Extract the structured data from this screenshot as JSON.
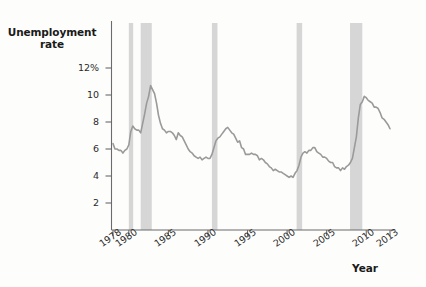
{
  "chart_data": {
    "type": "line",
    "title": "",
    "xlabel": "Year",
    "ylabel": "Unemployment rate",
    "ylabel_line1": "Unemployment",
    "ylabel_line2": "rate",
    "xlim": [
      1978,
      2013
    ],
    "ylim": [
      0,
      12.6
    ],
    "grid": false,
    "legend": null,
    "line_color": "#9a9a9a",
    "recession_band_color": "#d6d6d6",
    "axis_color": "#6b6b6b",
    "background_color": "#fdfdfc",
    "ytick_labels": [
      "12%",
      "10",
      "8",
      "6",
      "4",
      "2"
    ],
    "ytick_values": [
      12,
      10,
      8,
      6,
      4,
      2
    ],
    "xtick_labels": [
      "1978",
      "1980",
      "1985",
      "1990",
      "1995",
      "2000",
      "2005",
      "2010",
      "2013"
    ],
    "xtick_values": [
      1978,
      1980,
      1985,
      1990,
      1995,
      2000,
      2005,
      2010,
      2013
    ],
    "recession_bands": [
      {
        "label": "1980 recession",
        "start": 1980.0,
        "end": 1980.55
      },
      {
        "label": "1981-82 recession",
        "start": 1981.5,
        "end": 1982.9
      },
      {
        "label": "1990-91 recession",
        "start": 1990.5,
        "end": 1991.2
      },
      {
        "label": "2001 recession",
        "start": 2001.2,
        "end": 2001.9
      },
      {
        "label": "2007-09 recession",
        "start": 2007.95,
        "end": 2009.5
      }
    ],
    "series": [
      {
        "name": "Unemployment rate",
        "x": [
          1978.0,
          1978.25,
          1978.5,
          1978.75,
          1979.0,
          1979.25,
          1979.5,
          1979.75,
          1980.0,
          1980.25,
          1980.5,
          1980.75,
          1981.0,
          1981.25,
          1981.5,
          1981.75,
          1982.0,
          1982.25,
          1982.5,
          1982.75,
          1983.0,
          1983.25,
          1983.5,
          1983.75,
          1984.0,
          1984.25,
          1984.5,
          1984.75,
          1985.0,
          1985.25,
          1985.5,
          1985.75,
          1986.0,
          1986.25,
          1986.5,
          1986.75,
          1987.0,
          1987.25,
          1987.5,
          1987.75,
          1988.0,
          1988.25,
          1988.5,
          1988.75,
          1989.0,
          1989.25,
          1989.5,
          1989.75,
          1990.0,
          1990.25,
          1990.5,
          1990.75,
          1991.0,
          1991.25,
          1991.5,
          1991.75,
          1992.0,
          1992.25,
          1992.5,
          1992.75,
          1993.0,
          1993.25,
          1993.5,
          1993.75,
          1994.0,
          1994.25,
          1994.5,
          1994.75,
          1995.0,
          1995.25,
          1995.5,
          1995.75,
          1996.0,
          1996.25,
          1996.5,
          1996.75,
          1997.0,
          1997.25,
          1997.5,
          1997.75,
          1998.0,
          1998.25,
          1998.5,
          1998.75,
          1999.0,
          1999.25,
          1999.5,
          1999.75,
          2000.0,
          2000.25,
          2000.5,
          2000.75,
          2001.0,
          2001.25,
          2001.5,
          2001.75,
          2002.0,
          2002.25,
          2002.5,
          2002.75,
          2003.0,
          2003.25,
          2003.5,
          2003.75,
          2004.0,
          2004.25,
          2004.5,
          2004.75,
          2005.0,
          2005.25,
          2005.5,
          2005.75,
          2006.0,
          2006.25,
          2006.5,
          2006.75,
          2007.0,
          2007.25,
          2007.5,
          2007.75,
          2008.0,
          2008.25,
          2008.5,
          2008.75,
          2009.0,
          2009.25,
          2009.5,
          2009.75,
          2010.0,
          2010.25,
          2010.5,
          2010.75,
          2011.0,
          2011.25,
          2011.5,
          2011.75,
          2012.0,
          2012.25,
          2012.5,
          2012.75,
          2013.0
        ],
        "y": [
          6.4,
          6.0,
          6.0,
          5.9,
          5.9,
          5.7,
          5.9,
          6.0,
          6.3,
          7.3,
          7.7,
          7.5,
          7.4,
          7.4,
          7.2,
          7.9,
          8.6,
          9.4,
          9.9,
          10.7,
          10.4,
          10.1,
          9.4,
          8.5,
          7.9,
          7.5,
          7.4,
          7.2,
          7.3,
          7.3,
          7.2,
          7.0,
          6.7,
          7.2,
          7.0,
          6.9,
          6.6,
          6.3,
          6.0,
          5.8,
          5.7,
          5.5,
          5.4,
          5.3,
          5.4,
          5.2,
          5.3,
          5.4,
          5.3,
          5.3,
          5.6,
          6.1,
          6.6,
          6.8,
          6.9,
          7.1,
          7.3,
          7.5,
          7.6,
          7.4,
          7.2,
          7.1,
          6.8,
          6.5,
          6.6,
          6.1,
          6.0,
          5.6,
          5.6,
          5.6,
          5.7,
          5.6,
          5.6,
          5.5,
          5.2,
          5.3,
          5.2,
          5.0,
          4.9,
          4.7,
          4.6,
          4.4,
          4.5,
          4.4,
          4.3,
          4.3,
          4.2,
          4.1,
          4.0,
          3.9,
          4.0,
          3.9,
          4.2,
          4.4,
          4.8,
          5.4,
          5.7,
          5.8,
          5.7,
          5.9,
          5.9,
          6.1,
          6.1,
          5.8,
          5.7,
          5.6,
          5.4,
          5.4,
          5.3,
          5.1,
          5.0,
          5.0,
          4.7,
          4.6,
          4.6,
          4.4,
          4.6,
          4.5,
          4.7,
          4.8,
          5.0,
          5.3,
          6.1,
          6.9,
          8.3,
          9.3,
          9.5,
          9.9,
          9.8,
          9.6,
          9.5,
          9.4,
          9.1,
          9.1,
          9.0,
          8.7,
          8.3,
          8.2,
          8.0,
          7.8,
          7.5
        ]
      }
    ],
    "annotations": []
  }
}
